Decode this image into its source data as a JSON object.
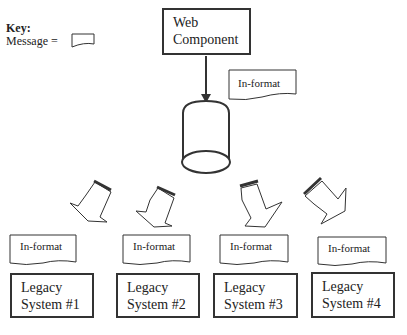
{
  "key": {
    "title": "Key:",
    "label": "Message ="
  },
  "web_component": {
    "line1": "Web",
    "line2": "Component"
  },
  "top_message": "In-format",
  "messages": [
    "In-format",
    "In-format",
    "In-format",
    "In-format"
  ],
  "legacy_systems": [
    {
      "line1": "Legacy",
      "line2": "System #1"
    },
    {
      "line1": "Legacy",
      "line2": "System #2"
    },
    {
      "line1": "Legacy",
      "line2": "System #3"
    },
    {
      "line1": "Legacy",
      "line2": "System #4"
    }
  ],
  "colors": {
    "stroke": "#333333",
    "background": "#ffffff"
  }
}
